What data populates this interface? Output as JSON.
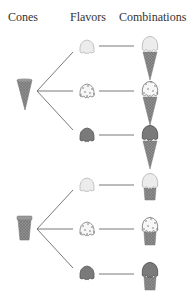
{
  "headers": {
    "cones": "Cones",
    "flavors": "Flavors",
    "combinations": "Combinations"
  },
  "diagram": {
    "type": "tree-diagram",
    "cones": [
      {
        "name": "sugar-cone",
        "flavors": [
          "vanilla",
          "chocolate-chip",
          "chocolate"
        ]
      },
      {
        "name": "cup-cone",
        "flavors": [
          "vanilla",
          "chocolate-chip",
          "chocolate"
        ]
      }
    ],
    "flavor_colors": {
      "vanilla": "#ececec",
      "chocolate-chip": "#f4f4f4",
      "chocolate": "#7a7a7a"
    },
    "cone_color": "#8e8e8e",
    "line_color": "#6a6a6a"
  }
}
